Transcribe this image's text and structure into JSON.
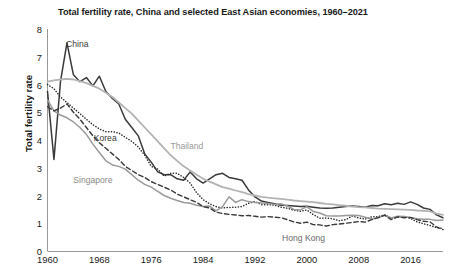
{
  "chart_data": {
    "type": "line",
    "title": "Total fertility rate, China and selected East Asian economies, 1960–2021",
    "xlabel": "",
    "ylabel": "Total fertility rate",
    "xlim": [
      1960,
      2021
    ],
    "ylim": [
      0,
      8
    ],
    "grid": false,
    "legend_position": "inline-annotations",
    "xticks": [
      "1960",
      "1968",
      "1976",
      "1984",
      "1992",
      "2000",
      "2008",
      "2016"
    ],
    "xtick_values": [
      1960,
      1968,
      1976,
      1984,
      1992,
      2000,
      2008,
      2016
    ],
    "yticks": [
      "0",
      "1",
      "2",
      "3",
      "4",
      "5",
      "6",
      "7",
      "8"
    ],
    "ytick_values": [
      0,
      1,
      2,
      3,
      4,
      5,
      6,
      7,
      8
    ],
    "x": [
      1960,
      1961,
      1962,
      1963,
      1964,
      1965,
      1966,
      1967,
      1968,
      1969,
      1970,
      1971,
      1972,
      1973,
      1974,
      1975,
      1976,
      1977,
      1978,
      1979,
      1980,
      1981,
      1982,
      1983,
      1984,
      1985,
      1986,
      1987,
      1988,
      1989,
      1990,
      1991,
      1992,
      1993,
      1994,
      1995,
      1996,
      1997,
      1998,
      1999,
      2000,
      2001,
      2002,
      2003,
      2004,
      2005,
      2006,
      2007,
      2008,
      2009,
      2010,
      2011,
      2012,
      2013,
      2014,
      2015,
      2016,
      2017,
      2018,
      2019,
      2020,
      2021
    ],
    "series": [
      {
        "name": "China",
        "style": "solid",
        "color": "#3a3a3a",
        "width": 1.5,
        "label_x": 1964.6,
        "label_y": 7.45,
        "label_color": "#3a3a3a",
        "values": [
          5.75,
          3.3,
          6.1,
          7.5,
          6.35,
          6.1,
          6.25,
          5.95,
          6.3,
          5.75,
          5.5,
          5.3,
          4.75,
          4.45,
          4.15,
          3.5,
          3.2,
          2.85,
          2.75,
          2.75,
          2.6,
          2.55,
          2.85,
          2.6,
          2.45,
          2.6,
          2.75,
          2.8,
          2.65,
          2.6,
          2.55,
          2.2,
          1.95,
          1.8,
          1.75,
          1.7,
          1.65,
          1.64,
          1.62,
          1.6,
          1.61,
          1.58,
          1.55,
          1.54,
          1.55,
          1.58,
          1.6,
          1.62,
          1.6,
          1.58,
          1.64,
          1.63,
          1.7,
          1.67,
          1.72,
          1.68,
          1.77,
          1.68,
          1.55,
          1.5,
          1.3,
          1.2
        ]
      },
      {
        "name": "Korea",
        "style": "dotted",
        "color": "#2a2a2a",
        "width": 1.5,
        "label_x": 1968.9,
        "label_y": 4.08,
        "label_color": "#3a3a3a",
        "values": [
          6.0,
          5.85,
          5.55,
          5.35,
          5.15,
          4.95,
          4.75,
          4.55,
          4.4,
          4.3,
          4.3,
          4.25,
          4.1,
          3.95,
          3.75,
          3.45,
          3.05,
          2.95,
          2.7,
          2.8,
          2.8,
          2.65,
          2.45,
          2.1,
          1.85,
          1.7,
          1.6,
          1.55,
          1.57,
          1.58,
          1.6,
          1.72,
          1.78,
          1.67,
          1.67,
          1.65,
          1.58,
          1.54,
          1.47,
          1.43,
          1.48,
          1.31,
          1.18,
          1.19,
          1.16,
          1.09,
          1.13,
          1.26,
          1.19,
          1.15,
          1.23,
          1.24,
          1.3,
          1.19,
          1.21,
          1.24,
          1.17,
          1.05,
          0.98,
          0.92,
          0.84,
          0.81
        ]
      },
      {
        "name": "Thailand",
        "style": "solid",
        "color": "#b3b3b3",
        "width": 1.8,
        "label_x": 1981.5,
        "label_y": 3.78,
        "label_color": "#9a9a9a",
        "values": [
          6.1,
          6.15,
          6.18,
          6.2,
          6.18,
          6.12,
          6.05,
          5.95,
          5.85,
          5.7,
          5.55,
          5.35,
          5.15,
          4.95,
          4.7,
          4.45,
          4.2,
          3.95,
          3.7,
          3.45,
          3.25,
          3.05,
          2.9,
          2.75,
          2.6,
          2.5,
          2.4,
          2.3,
          2.25,
          2.18,
          2.12,
          2.05,
          2.0,
          1.95,
          1.92,
          1.9,
          1.88,
          1.85,
          1.82,
          1.8,
          1.78,
          1.76,
          1.73,
          1.7,
          1.68,
          1.65,
          1.63,
          1.6,
          1.58,
          1.57,
          1.55,
          1.53,
          1.52,
          1.51,
          1.5,
          1.49,
          1.48,
          1.46,
          1.45,
          1.43,
          1.35,
          1.3
        ]
      },
      {
        "name": "Singapore",
        "style": "solid",
        "color": "#9a9a9a",
        "width": 1.5,
        "label_x": 1967.0,
        "label_y": 2.55,
        "label_color": "#8a8a8a",
        "values": [
          5.45,
          5.05,
          4.9,
          4.8,
          4.65,
          4.45,
          4.2,
          3.85,
          3.55,
          3.25,
          3.1,
          3.05,
          2.95,
          2.75,
          2.55,
          2.4,
          2.3,
          2.15,
          2.0,
          1.9,
          1.82,
          1.75,
          1.72,
          1.65,
          1.6,
          1.62,
          1.45,
          1.6,
          1.95,
          1.75,
          1.85,
          1.78,
          1.75,
          1.73,
          1.71,
          1.68,
          1.7,
          1.62,
          1.5,
          1.48,
          1.6,
          1.42,
          1.37,
          1.27,
          1.26,
          1.26,
          1.28,
          1.29,
          1.28,
          1.22,
          1.15,
          1.2,
          1.29,
          1.19,
          1.25,
          1.24,
          1.2,
          1.16,
          1.14,
          1.14,
          1.1,
          1.12
        ]
      },
      {
        "name": "Hong Kong",
        "style": "dashed",
        "color": "#3a3a3a",
        "width": 1.4,
        "label_x": 1999.5,
        "label_y": 0.46,
        "label_color": "#6a6a6a",
        "values": [
          5.2,
          5.05,
          5.15,
          5.3,
          5.0,
          4.75,
          4.45,
          4.15,
          3.9,
          3.7,
          3.5,
          3.3,
          3.05,
          2.9,
          2.75,
          2.65,
          2.5,
          2.4,
          2.3,
          2.2,
          2.05,
          1.95,
          1.85,
          1.75,
          1.6,
          1.55,
          1.4,
          1.35,
          1.32,
          1.3,
          1.27,
          1.28,
          1.25,
          1.22,
          1.24,
          1.22,
          1.2,
          1.13,
          1.05,
          1.0,
          1.04,
          0.95,
          0.94,
          0.9,
          0.95,
          0.97,
          1.0,
          1.03,
          1.06,
          1.04,
          1.13,
          1.2,
          1.29,
          1.13,
          1.23,
          1.2,
          1.21,
          1.13,
          1.07,
          1.05,
          0.87,
          0.77
        ]
      }
    ]
  }
}
